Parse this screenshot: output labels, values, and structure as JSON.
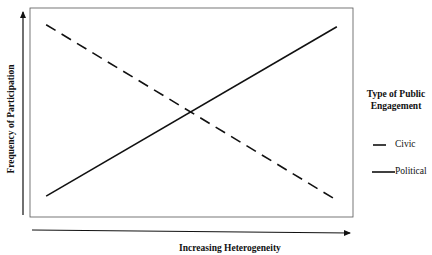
{
  "chart_data": {
    "type": "line",
    "title": "",
    "xlabel": "Increasing Heterogeneity",
    "ylabel": "Frequency of Participation",
    "xlim": [
      0,
      1
    ],
    "ylim": [
      0,
      1
    ],
    "grid": false,
    "legend": {
      "title": "Type of Public Engagement",
      "title_line1": "Type of Public",
      "title_line2": "Engagement",
      "placement": "right"
    },
    "series": [
      {
        "name": "Civic",
        "style": "dashed",
        "x": [
          0.05,
          0.95
        ],
        "y": [
          0.92,
          0.08
        ]
      },
      {
        "name": "Political",
        "style": "solid",
        "x": [
          0.05,
          0.95
        ],
        "y": [
          0.1,
          0.91
        ]
      }
    ]
  }
}
